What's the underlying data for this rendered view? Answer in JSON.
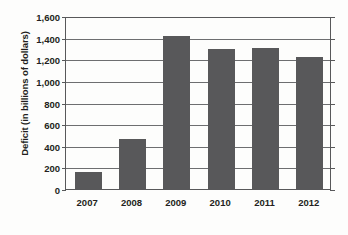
{
  "chart_data": {
    "type": "bar",
    "title": "",
    "xlabel": "",
    "ylabel": "Deficit (in billions of dollars)",
    "categories": [
      "2007",
      "2008",
      "2009",
      "2010",
      "2011",
      "2012"
    ],
    "values": [
      161,
      459,
      1413,
      1294,
      1300,
      1224
    ],
    "ylim": [
      0,
      1600
    ],
    "yticks": [
      0,
      200,
      400,
      600,
      800,
      1000,
      1200,
      1400,
      1600
    ],
    "ytick_labels": [
      "0",
      "200",
      "400",
      "600",
      "800",
      "1,000",
      "1,200",
      "1,400",
      "1,600"
    ],
    "grid": true,
    "legend": false,
    "series": [
      {
        "name": "Deficit",
        "values": [
          161,
          459,
          1413,
          1294,
          1300,
          1224
        ],
        "color": "#58585a"
      }
    ]
  },
  "colors": {
    "bar": "#58585a",
    "axis": "#58585a",
    "gridline": "#6d6e70",
    "text": "#231f20",
    "background": "#fdfdfc"
  }
}
